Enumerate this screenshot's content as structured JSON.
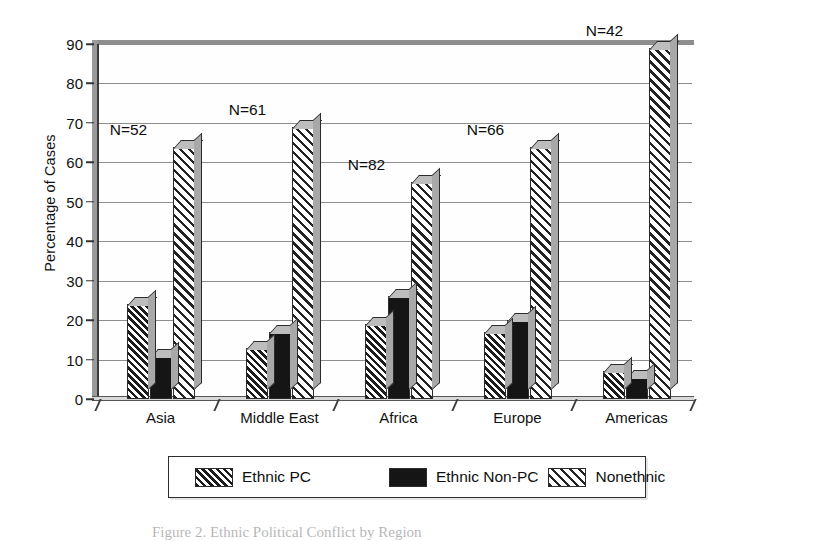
{
  "chart_data": {
    "type": "bar",
    "title": "",
    "subtitle": "",
    "xlabel": "",
    "ylabel": "Percentage of Cases",
    "ylim": [
      0,
      90
    ],
    "ytick_step": 10,
    "yticks": [
      0,
      10,
      20,
      30,
      40,
      50,
      60,
      70,
      80,
      90
    ],
    "grid": true,
    "grid_axis": "y",
    "legend_position": "bottom",
    "style": "3d-grouped-bars-grayscale-scan",
    "categories": [
      "Asia",
      "Middle East",
      "Africa",
      "Europe",
      "Americas"
    ],
    "series": [
      {
        "name": "Ethnic PC",
        "pattern": "dense-diagonal-hatch",
        "values": [
          24,
          13,
          19,
          17,
          7
        ]
      },
      {
        "name": "Ethnic Non-PC",
        "pattern": "solid-black",
        "values": [
          11,
          17,
          26,
          20,
          5.5
        ]
      },
      {
        "name": "Nonethnic",
        "pattern": "wide-diagonal-hatch",
        "values": [
          64,
          69,
          55,
          64,
          89
        ]
      }
    ],
    "annotations": [
      {
        "text": "N=52",
        "category": "Asia"
      },
      {
        "text": "N=61",
        "category": "Middle East"
      },
      {
        "text": "N=82",
        "category": "Africa"
      },
      {
        "text": "N=66",
        "category": "Europe"
      },
      {
        "text": "N=42",
        "category": "Americas"
      }
    ],
    "group_n_counts": {
      "Asia": 52,
      "Middle East": 61,
      "Africa": 82,
      "Europe": 66,
      "Americas": 42
    }
  },
  "legend": {
    "items": [
      {
        "label": "Ethnic PC",
        "swatch": "dense-diagonal-hatch"
      },
      {
        "label": "Ethnic Non-PC",
        "swatch": "solid-black"
      },
      {
        "label": "Nonethnic",
        "swatch": "wide-diagonal-hatch"
      }
    ]
  },
  "caption": {
    "text": "Figure 2. Ethnic Political Conflict by Region"
  },
  "colors": {
    "ink": "#1a1a1a",
    "grid": "#8d8d8d",
    "axis": "#3a3a3a",
    "bar_top": "#bdbdbd",
    "bar_side": "#a8a8a8",
    "solid_fill": "#151515",
    "page": "#ffffff"
  }
}
